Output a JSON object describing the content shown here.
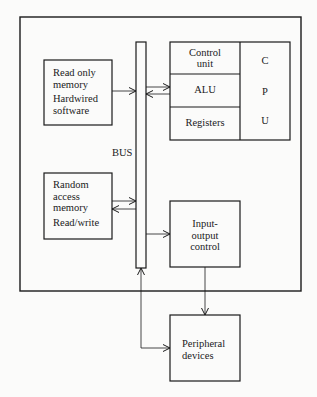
{
  "rom": {
    "line1": "Read only",
    "line2": "memory",
    "line3": "Hardwired",
    "line4": "software"
  },
  "ram": {
    "line1": "Random",
    "line2": "access",
    "line3": "memory",
    "line4": "Read/write"
  },
  "bus": {
    "label": "BUS"
  },
  "cpu": {
    "control_line1": "Control",
    "control_line2": "unit",
    "alu": "ALU",
    "registers": "Registers",
    "letters": [
      "C",
      "P",
      "U"
    ]
  },
  "io": {
    "line1": "Input-",
    "line2": "output",
    "line3": "control"
  },
  "peripheral": {
    "line1": "Peripheral",
    "line2": "devices"
  }
}
